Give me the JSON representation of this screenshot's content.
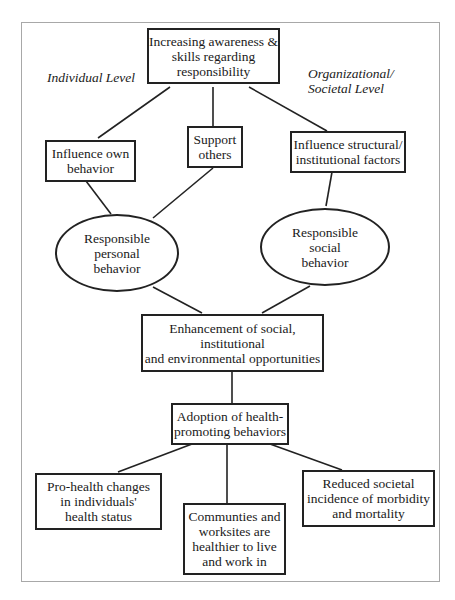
{
  "diagram": {
    "labels": {
      "individual_level": "Individual Level",
      "organizational_level": "Organizational/\nSocietal Level"
    },
    "nodes": {
      "awareness": "Increasing awareness &\nskills regarding\nresponsibility",
      "influence_own": "Influence own\nbehavior",
      "support_others": "Support\nothers",
      "influence_structural": "Influence structural/\ninstitutional factors",
      "personal_behavior": "Responsible\npersonal\nbehavior",
      "social_behavior": "Responsible\nsocial\nbehavior",
      "enhancement": "Enhancement of social,\ninstitutional\nand environmental opportunities",
      "adoption": "Adoption of health-\npromoting behaviors",
      "pro_health": "Pro-health changes\nin individuals'\nhealth status",
      "communities": "Communties and\nworksites are\nhealthier to live\nand work in",
      "reduced": "Reduced societal\nincidence of morbidity\nand mortality"
    },
    "edges": [
      [
        "awareness",
        "influence_own"
      ],
      [
        "awareness",
        "support_others"
      ],
      [
        "awareness",
        "influence_structural"
      ],
      [
        "influence_own",
        "personal_behavior"
      ],
      [
        "support_others",
        "personal_behavior"
      ],
      [
        "influence_structural",
        "social_behavior"
      ],
      [
        "personal_behavior",
        "enhancement"
      ],
      [
        "social_behavior",
        "enhancement"
      ],
      [
        "enhancement",
        "adoption"
      ],
      [
        "adoption",
        "pro_health"
      ],
      [
        "adoption",
        "communities"
      ],
      [
        "adoption",
        "reduced"
      ]
    ]
  }
}
